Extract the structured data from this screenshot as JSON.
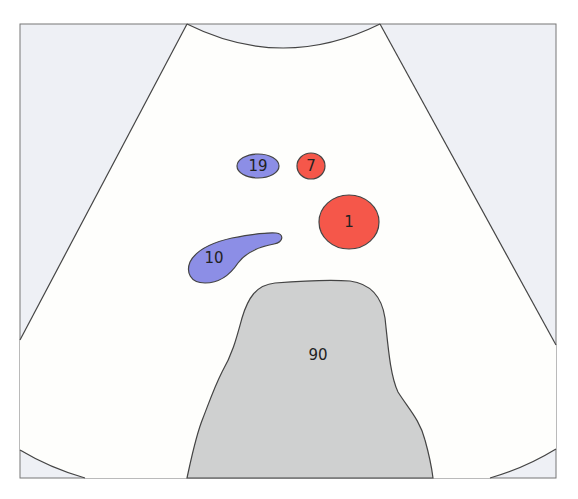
{
  "diagram": {
    "type": "ultrasound-schematic",
    "colors": {
      "outside_background": "#eef0f5",
      "fan_background": "#fefefc",
      "outline": "#444444",
      "blue_structure": "#8c8ee6",
      "red_structure": "#f5574a",
      "grey_structure": "#cfd0d0"
    },
    "structures": [
      {
        "id": "s19",
        "label": "19",
        "color": "blue",
        "shape": "ellipse"
      },
      {
        "id": "s7",
        "label": "7",
        "color": "red",
        "shape": "ellipse"
      },
      {
        "id": "s1",
        "label": "1",
        "color": "red",
        "shape": "ellipse"
      },
      {
        "id": "s10",
        "label": "10",
        "color": "blue",
        "shape": "elongated-blob"
      },
      {
        "id": "s90",
        "label": "90",
        "color": "grey",
        "shape": "large-mass"
      }
    ]
  }
}
